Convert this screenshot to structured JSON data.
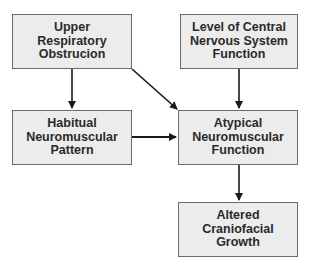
{
  "diagram": {
    "nodes": [
      {
        "id": "upper",
        "label": "Upper\nRespiratory\nObstrucion"
      },
      {
        "id": "cns",
        "label": "Level of Central\nNervous System\nFunction"
      },
      {
        "id": "habitual",
        "label": "Habitual\nNeuromuscular\nPattern"
      },
      {
        "id": "atypical",
        "label": "Atypical\nNeuromuscular\nFunction"
      },
      {
        "id": "altered",
        "label": "Altered\nCraniofacial\nGrowth"
      }
    ],
    "edges": [
      {
        "from": "upper",
        "to": "habitual"
      },
      {
        "from": "upper",
        "to": "atypical"
      },
      {
        "from": "cns",
        "to": "atypical"
      },
      {
        "from": "habitual",
        "to": "atypical"
      },
      {
        "from": "atypical",
        "to": "altered"
      }
    ],
    "colors": {
      "box_fill": "#ececec",
      "box_border": "#6b6b6b",
      "arrow": "#1a1a1a",
      "text": "#2a2a2a"
    }
  }
}
